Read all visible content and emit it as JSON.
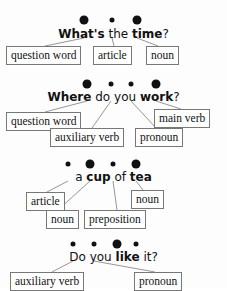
{
  "page": {
    "background_color": "#fdfdfd",
    "text_color": "#111111",
    "box_border_color": "#777777",
    "leader_line_color": "#8a8a8a",
    "dot_color": "#111111"
  },
  "groups": [
    {
      "id": "group-whats-the-time",
      "sentence_text": "What's the time?",
      "words": [
        {
          "text": "What's",
          "stressed": true
        },
        {
          "text": "the",
          "stressed": false
        },
        {
          "text": "time",
          "stressed": true
        },
        {
          "text": "?",
          "stressed": false
        }
      ],
      "dots": [
        {
          "size": "big",
          "x": 84
        },
        {
          "size": "small",
          "x": 112
        },
        {
          "size": "big",
          "x": 137
        }
      ],
      "labels": [
        {
          "text": "question word",
          "x": 6,
          "y": 46,
          "row": 1
        },
        {
          "text": "article",
          "x": 93,
          "y": 46,
          "row": 1
        },
        {
          "text": "noun",
          "x": 146,
          "y": 46,
          "row": 1
        }
      ]
    },
    {
      "id": "group-where-do-you-work",
      "sentence_text": "Where do you work?",
      "words": [
        {
          "text": "Where",
          "stressed": true
        },
        {
          "text": "do",
          "stressed": false
        },
        {
          "text": "you",
          "stressed": false
        },
        {
          "text": "work",
          "stressed": true
        },
        {
          "text": "?",
          "stressed": false
        }
      ],
      "dots": [
        {
          "size": "big",
          "x": 87
        },
        {
          "size": "small",
          "x": 111
        },
        {
          "size": "small",
          "x": 131
        },
        {
          "size": "big",
          "x": 156
        }
      ],
      "labels": [
        {
          "text": "question word",
          "x": 6,
          "y": 112,
          "row": 1
        },
        {
          "text": "main verb",
          "x": 154,
          "y": 109,
          "row": 1
        },
        {
          "text": "auxiliary verb",
          "x": 50,
          "y": 128,
          "row": 2
        },
        {
          "text": "pronoun",
          "x": 135,
          "y": 128,
          "row": 2
        }
      ]
    },
    {
      "id": "group-a-cup-of-tea",
      "sentence_text": "a cup of tea",
      "words": [
        {
          "text": "a",
          "stressed": false
        },
        {
          "text": "cup",
          "stressed": true
        },
        {
          "text": "of",
          "stressed": false
        },
        {
          "text": "tea",
          "stressed": true
        }
      ],
      "dots": [
        {
          "size": "small",
          "x": 68
        },
        {
          "size": "big",
          "x": 90
        },
        {
          "size": "small",
          "x": 113
        },
        {
          "size": "big",
          "x": 136
        }
      ],
      "labels": [
        {
          "text": "article",
          "x": 26,
          "y": 192,
          "row": 1
        },
        {
          "text": "noun",
          "x": 131,
          "y": 190,
          "row": 1
        },
        {
          "text": "noun",
          "x": 46,
          "y": 210,
          "row": 2
        },
        {
          "text": "preposition",
          "x": 84,
          "y": 210,
          "row": 2
        }
      ]
    },
    {
      "id": "group-do-you-like-it",
      "sentence_text": "Do you like it?",
      "words": [
        {
          "text": "Do",
          "stressed": false
        },
        {
          "text": "you",
          "stressed": false
        },
        {
          "text": "like",
          "stressed": true
        },
        {
          "text": "it",
          "stressed": false
        },
        {
          "text": "?",
          "stressed": false
        }
      ],
      "dots": [
        {
          "size": "small",
          "x": 73
        },
        {
          "size": "small",
          "x": 94
        },
        {
          "size": "big",
          "x": 117
        },
        {
          "size": "small",
          "x": 136
        }
      ],
      "labels": [
        {
          "text": "auxiliary verb",
          "x": 10,
          "y": 272,
          "row": 1
        },
        {
          "text": "pronoun",
          "x": 134,
          "y": 272,
          "row": 1
        }
      ]
    }
  ]
}
